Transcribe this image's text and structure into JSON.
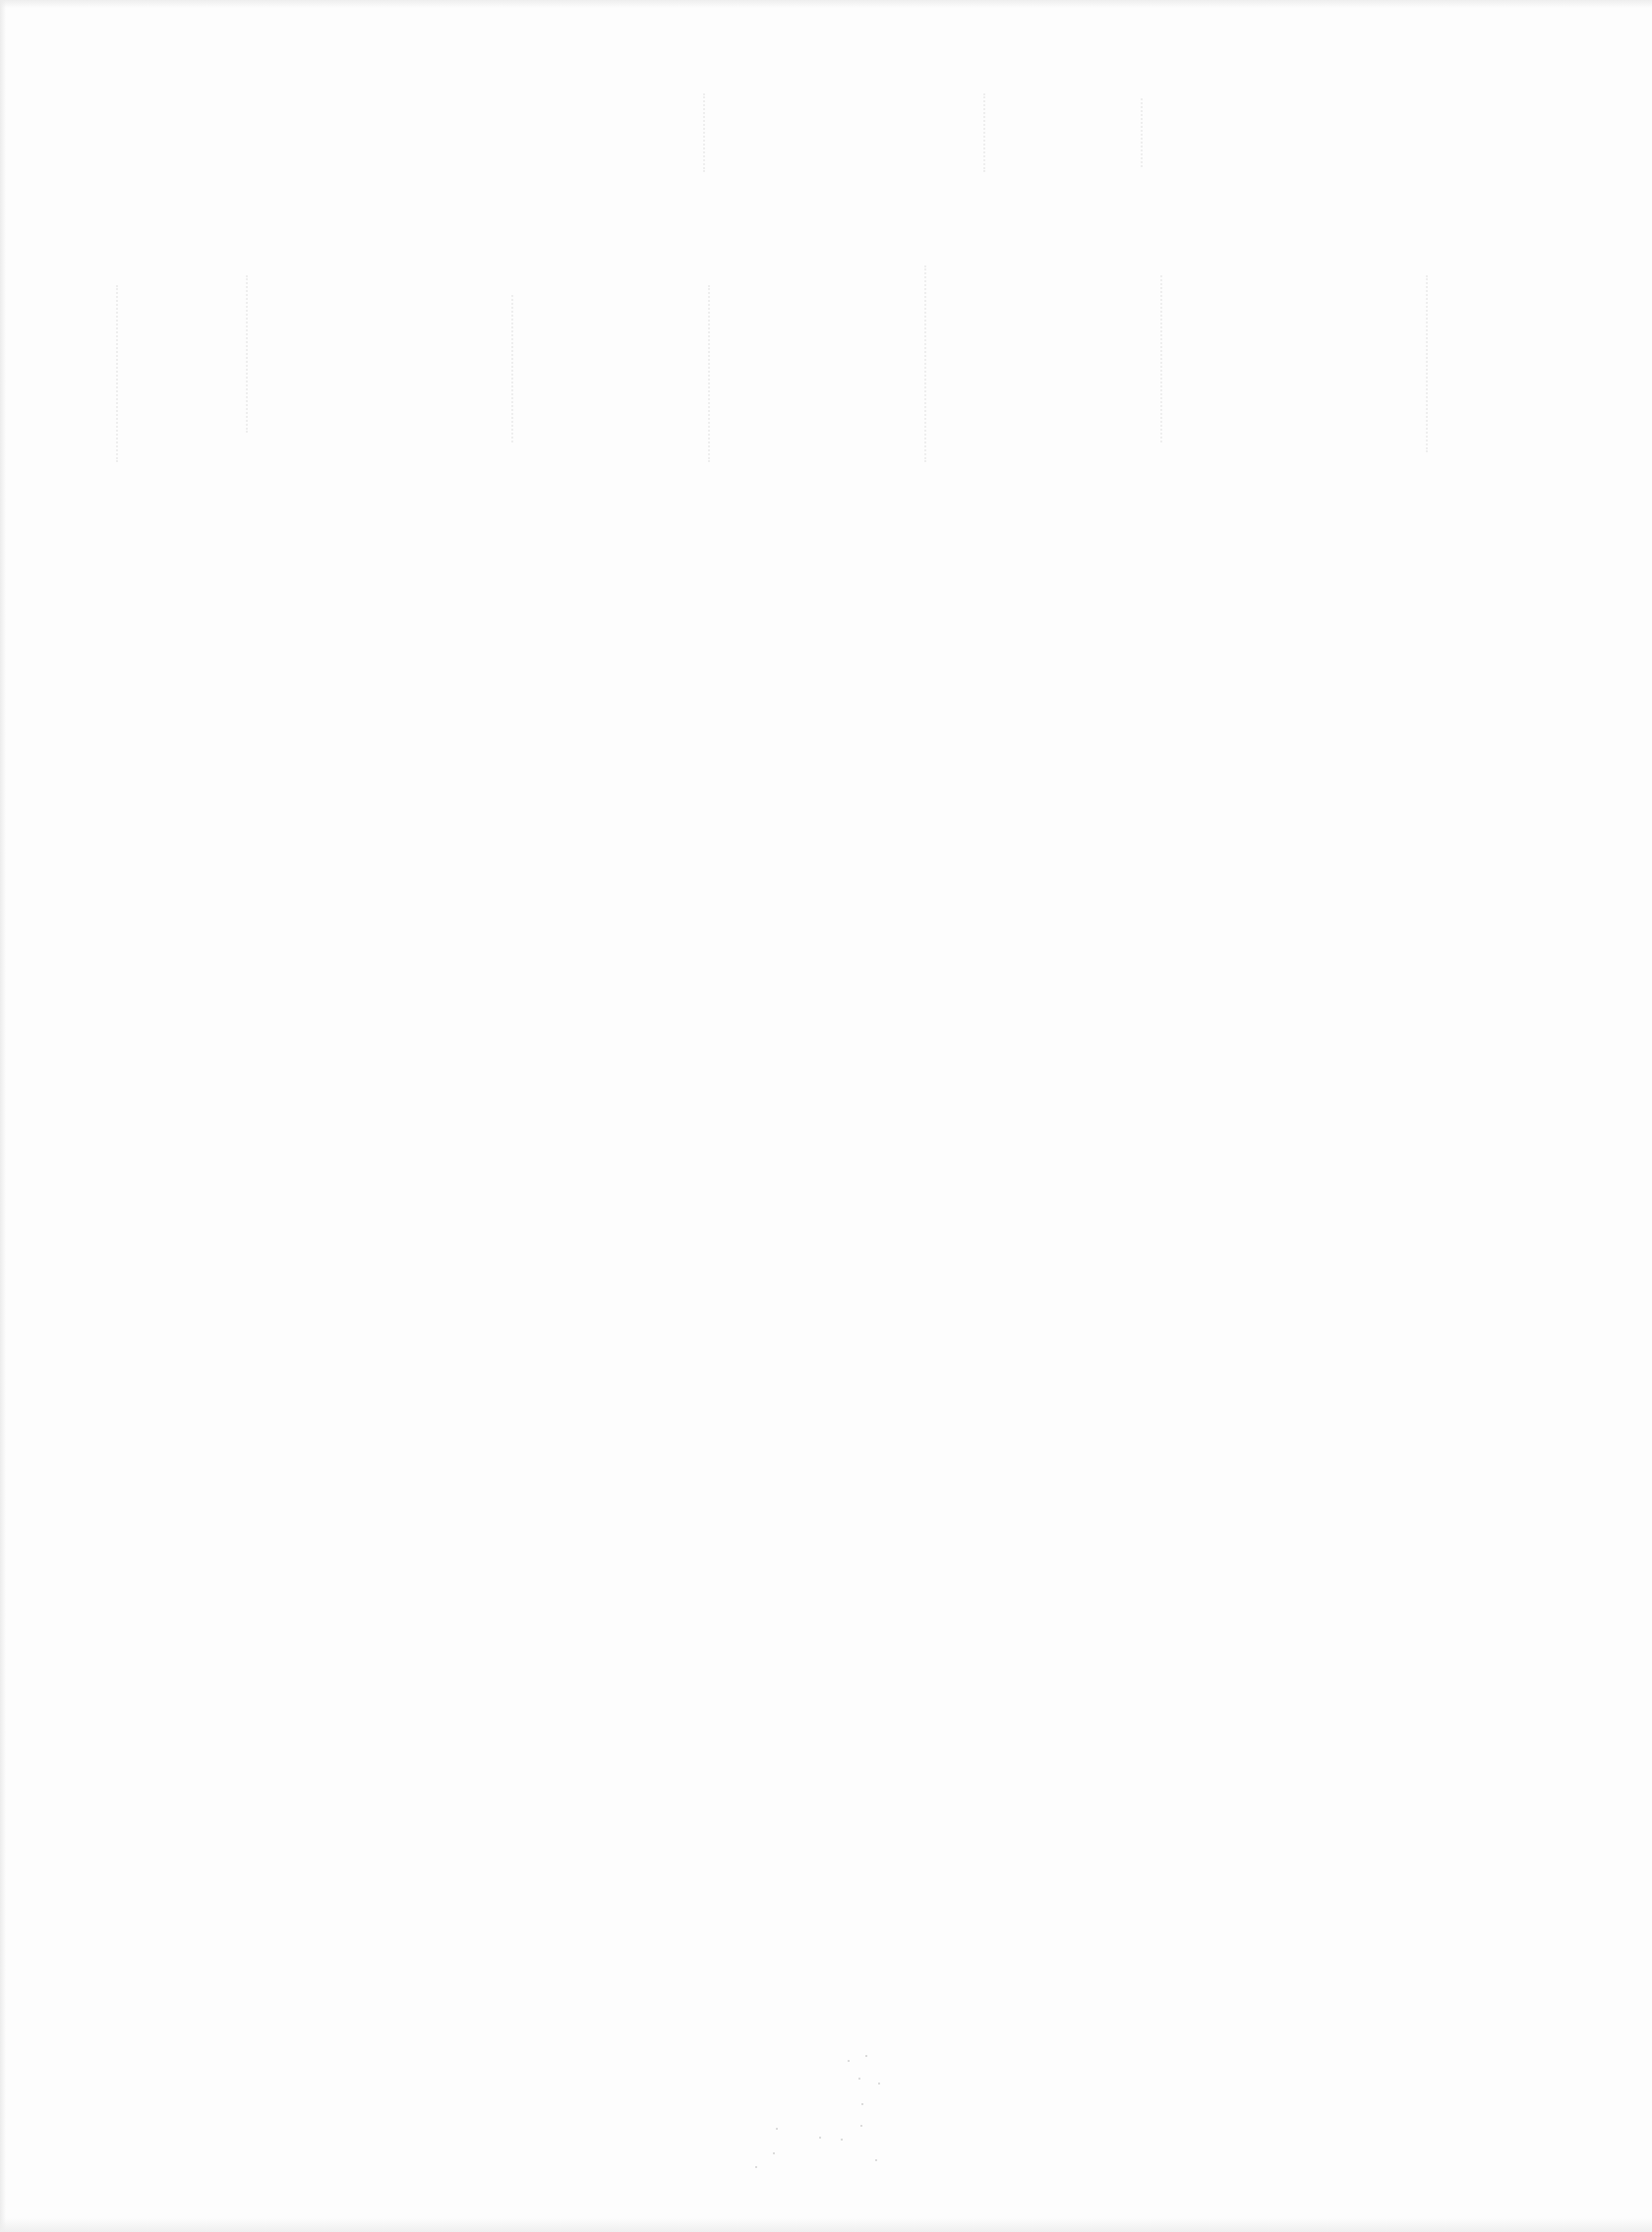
{
  "page": {
    "type": "blank-scanned-page",
    "background_color": "#fdfdfd",
    "has_legible_text": false,
    "bleed_through": {
      "present": true,
      "legible": false,
      "region": "upper third, large display lettering (mirrored, very faint)"
    },
    "noise": {
      "present": true,
      "region": "bottom center speckles"
    }
  }
}
